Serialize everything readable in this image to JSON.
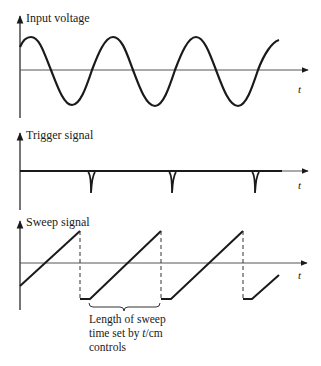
{
  "panels": [
    {
      "id": "input",
      "label": "Input voltage",
      "axis_label": "t"
    },
    {
      "id": "trigger",
      "label": "Trigger signal",
      "axis_label": "t"
    },
    {
      "id": "sweep",
      "label": "Sweep signal",
      "axis_label": "t"
    }
  ],
  "annotation": {
    "line1": "Length of sweep",
    "line2_prefix": "time set by ",
    "line2_italic": "t",
    "line2_suffix": "/cm",
    "line3": "controls"
  },
  "colors": {
    "stroke": "#1a1a1a",
    "axis": "#555555"
  }
}
